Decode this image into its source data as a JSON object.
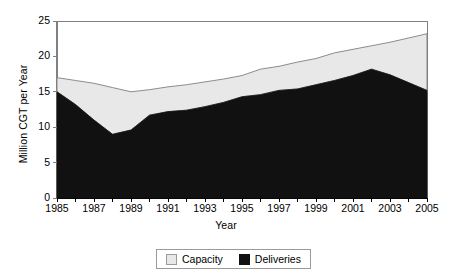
{
  "chart_data": {
    "type": "area",
    "stacked": true,
    "title": "",
    "xlabel": "Year",
    "ylabel": "Million CGT per Year",
    "xlim": [
      1985,
      2005
    ],
    "ylim": [
      0,
      25
    ],
    "yticks": [
      0,
      5,
      10,
      15,
      20,
      25
    ],
    "xticks": [
      1985,
      1987,
      1989,
      1991,
      1993,
      1995,
      1997,
      1999,
      2001,
      2003,
      2005
    ],
    "x": [
      1985,
      1986,
      1987,
      1988,
      1989,
      1990,
      1991,
      1992,
      1993,
      1994,
      1995,
      1996,
      1997,
      1998,
      1999,
      2000,
      2001,
      2002,
      2003,
      2004,
      2005
    ],
    "grid": false,
    "legend_position": "bottom",
    "series": [
      {
        "name": "Deliveries",
        "color": "#111111",
        "values": [
          15.0,
          13.2,
          11.0,
          9.0,
          9.6,
          11.7,
          12.2,
          12.4,
          12.9,
          13.5,
          14.3,
          14.6,
          15.2,
          15.4,
          16.0,
          16.6,
          17.3,
          18.2,
          17.4,
          16.3,
          15.2
        ]
      },
      {
        "name": "Capacity",
        "color": "#e8e8e8",
        "note": "Upper boundary of stack = total capacity",
        "values": [
          17.0,
          16.6,
          16.2,
          15.6,
          15.0,
          15.3,
          15.7,
          16.0,
          16.4,
          16.8,
          17.3,
          18.2,
          18.6,
          19.2,
          19.7,
          20.5,
          21.0,
          21.5,
          22.0,
          22.6,
          23.2
        ]
      }
    ]
  },
  "axes": {
    "ylabel": "Million CGT per Year",
    "xlabel": "Year",
    "yticks": [
      "0",
      "5",
      "10",
      "15",
      "20",
      "25"
    ],
    "xticks": [
      "1985",
      "1987",
      "1989",
      "1991",
      "1993",
      "1995",
      "1997",
      "1999",
      "2001",
      "2003",
      "2005"
    ]
  },
  "legend": {
    "items": [
      {
        "label": "Capacity",
        "swatch": "light-gray-square"
      },
      {
        "label": "Deliveries",
        "swatch": "black-square"
      }
    ]
  },
  "colors": {
    "capacity_fill": "#e8e8e8",
    "deliveries_fill": "#111111",
    "axis": "#808080",
    "line": "#808080",
    "background": "#ffffff"
  }
}
